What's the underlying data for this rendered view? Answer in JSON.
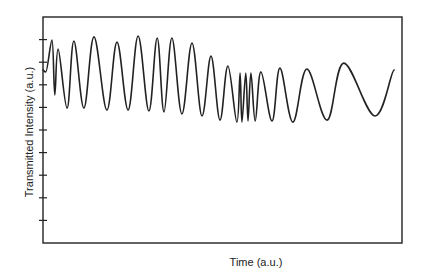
{
  "chart_data": {
    "type": "line",
    "title": "",
    "xlabel": "Time (a.u.)",
    "ylabel": "Transmitted Intensity (a.u.)",
    "xlim": [
      0,
      100
    ],
    "ylim": [
      0,
      10
    ],
    "grid": false,
    "legend": "none",
    "x_ticks": [],
    "y_ticks": [
      1,
      2,
      3,
      4,
      5,
      6,
      7,
      8,
      9
    ],
    "y_tick_labels": [],
    "series": [
      {
        "name": "Transmitted Intensity",
        "color": "#222222",
        "points": [
          [
            0.0,
            7.65
          ],
          [
            0.8,
            7.57
          ],
          [
            2.5,
            8.98
          ],
          [
            3.3,
            6.55
          ],
          [
            4.2,
            8.58
          ],
          [
            6.7,
            5.97
          ],
          [
            8.6,
            8.94
          ],
          [
            11.4,
            5.97
          ],
          [
            14.2,
            9.12
          ],
          [
            17.8,
            5.88
          ],
          [
            20.6,
            8.89
          ],
          [
            23.7,
            5.88
          ],
          [
            26.5,
            9.16
          ],
          [
            29.5,
            5.84
          ],
          [
            31.8,
            9.07
          ],
          [
            33.7,
            5.8
          ],
          [
            35.9,
            9.07
          ],
          [
            38.7,
            5.71
          ],
          [
            41.5,
            8.85
          ],
          [
            44.3,
            5.62
          ],
          [
            46.8,
            8.27
          ],
          [
            49.3,
            5.44
          ],
          [
            51.5,
            7.83
          ],
          [
            54.0,
            5.35
          ],
          [
            54.9,
            7.52
          ],
          [
            55.4,
            5.35
          ],
          [
            56.5,
            7.52
          ],
          [
            57.1,
            5.4
          ],
          [
            57.9,
            7.52
          ],
          [
            59.1,
            5.4
          ],
          [
            60.7,
            7.57
          ],
          [
            63.8,
            5.4
          ],
          [
            66.0,
            7.74
          ],
          [
            69.6,
            5.35
          ],
          [
            73.5,
            7.7
          ],
          [
            79.1,
            5.44
          ],
          [
            83.8,
            7.96
          ],
          [
            92.5,
            5.62
          ],
          [
            97.8,
            7.65
          ]
        ]
      }
    ]
  }
}
